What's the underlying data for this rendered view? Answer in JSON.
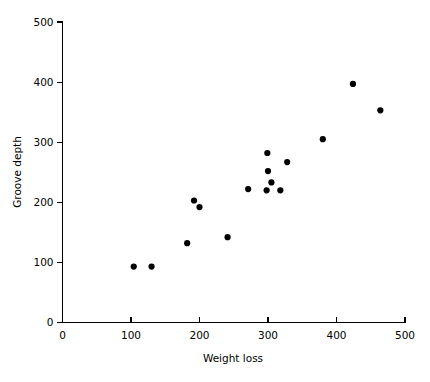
{
  "chart_data": {
    "type": "scatter",
    "title": "",
    "xlabel": "Weight loss",
    "ylabel": "Groove depth",
    "xlim": [
      0,
      500
    ],
    "ylim": [
      0,
      500
    ],
    "xticks": [
      0,
      100,
      200,
      300,
      400,
      500
    ],
    "yticks": [
      0,
      100,
      200,
      300,
      400,
      500
    ],
    "xticklabels": [
      "0",
      "100",
      "200",
      "300",
      "400",
      "500"
    ],
    "yticklabels": [
      "0",
      "100",
      "200",
      "300",
      "400",
      "500"
    ],
    "grid": false,
    "legend": false,
    "marker": "filled-circle",
    "marker_color": "#000000",
    "marker_size_px": 3.1,
    "points": [
      {
        "x": 104,
        "y": 93
      },
      {
        "x": 130,
        "y": 93
      },
      {
        "x": 182,
        "y": 132
      },
      {
        "x": 192,
        "y": 203
      },
      {
        "x": 200,
        "y": 192
      },
      {
        "x": 241,
        "y": 142
      },
      {
        "x": 271,
        "y": 222
      },
      {
        "x": 299,
        "y": 282
      },
      {
        "x": 300,
        "y": 252
      },
      {
        "x": 305,
        "y": 233
      },
      {
        "x": 298,
        "y": 220
      },
      {
        "x": 318,
        "y": 220
      },
      {
        "x": 328,
        "y": 267
      },
      {
        "x": 380,
        "y": 305
      },
      {
        "x": 424,
        "y": 397
      },
      {
        "x": 464,
        "y": 353
      }
    ]
  }
}
